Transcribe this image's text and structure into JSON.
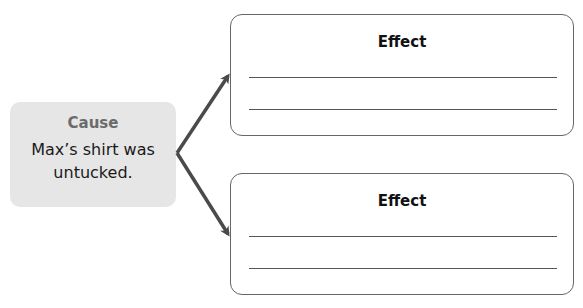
{
  "cause": {
    "title": "Cause",
    "text": "Max’s shirt was untucked."
  },
  "effects": [
    {
      "title": "Effect",
      "lines": [
        "",
        ""
      ]
    },
    {
      "title": "Effect",
      "lines": [
        "",
        ""
      ]
    }
  ],
  "colors": {
    "cause_bg": "#e6e6e6",
    "cause_title": "#6b6b6b",
    "arrow": "#4a4a4a",
    "box_border": "#666666"
  }
}
